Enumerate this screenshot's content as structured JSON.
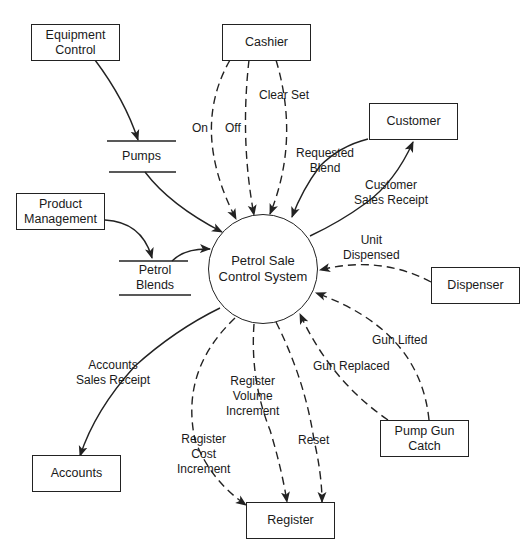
{
  "diagram": {
    "type": "data-flow-diagram (context diagram)",
    "process": {
      "label": "Petrol Sale\nControl System"
    },
    "entities": {
      "equipment_control": "Equipment\nControl",
      "cashier": "Cashier",
      "customer": "Customer",
      "product_management": "Product\nManagement",
      "dispenser": "Dispenser",
      "accounts": "Accounts",
      "register": "Register",
      "pump_gun_catch": "Pump Gun\nCatch"
    },
    "stores": {
      "pumps": "Pumps",
      "petrol_blends": "Petrol\nBlends"
    },
    "flows": {
      "on": "On",
      "off": "Off",
      "clear_set": "Clear Set",
      "requested_blend": "Requested\nBlend",
      "customer_sales_receipt": "Customer\nSales Receipt",
      "unit_dispensed": "Unit\nDispensed",
      "gun_lifted": "Gun Lifted",
      "gun_replaced": "Gun Replaced",
      "accounts_sales_receipt": "Accounts\nSales Receipt",
      "register_volume_increment": "Register\nVolume\nIncrement",
      "register_cost_increment": "Register\nCost\nIncrement",
      "reset": "Reset"
    },
    "colors": {
      "line": "#222222",
      "background": "#ffffff",
      "text": "#1a1a1a"
    }
  }
}
